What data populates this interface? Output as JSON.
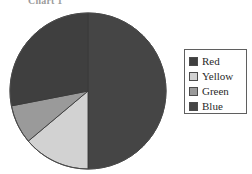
{
  "chart_data": {
    "type": "pie",
    "title": "Chart 1",
    "categories": [
      "Red",
      "Yellow",
      "Green",
      "Blue"
    ],
    "values": [
      28,
      14,
      8,
      50
    ],
    "unit": "percent",
    "colors": [
      "#3f3f3f",
      "#d2d2d2",
      "#9a9a9a",
      "#454545"
    ],
    "legend_position": "right",
    "grid": false,
    "xlabel": "",
    "ylabel": "",
    "start_angle_deg": 0,
    "direction": "clockwise",
    "slices": [
      {
        "label": "Blue",
        "value": 50,
        "color": "#454545",
        "start_deg": 0,
        "end_deg": 180
      },
      {
        "label": "Yellow",
        "value": 14,
        "color": "#d2d2d2",
        "start_deg": 180,
        "end_deg": 230
      },
      {
        "label": "Green",
        "value": 8,
        "color": "#9a9a9a",
        "start_deg": 230,
        "end_deg": 259
      },
      {
        "label": "Red",
        "value": 28,
        "color": "#3f3f3f",
        "start_deg": 259,
        "end_deg": 360
      }
    ]
  },
  "chart": {
    "title": "Chart 1",
    "outline_color": "#4b4b4b"
  },
  "legend": {
    "border_color": "#5f5f5f",
    "items": [
      {
        "label": "Red",
        "swatch": "#3f3f3f"
      },
      {
        "label": "Yellow",
        "swatch": "#d2d2d2"
      },
      {
        "label": "Green",
        "swatch": "#9a9a9a"
      },
      {
        "label": "Blue",
        "swatch": "#454545"
      }
    ]
  }
}
